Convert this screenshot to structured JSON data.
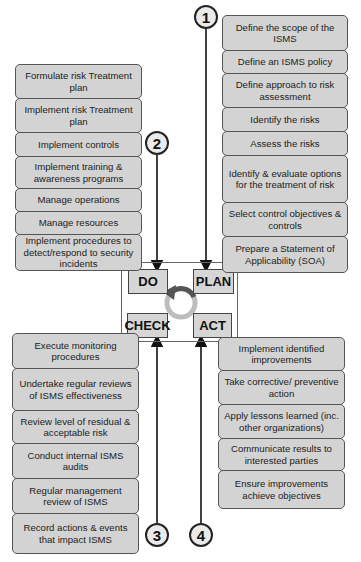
{
  "plan": {
    "number": "1",
    "label": "PLAN",
    "steps": [
      "Define the scope of the ISMS",
      "Define an ISMS policy",
      "Define approach to risk assessment",
      "Identify the risks",
      "Assess the risks",
      "Identify & evaluate options for the treatment of risk",
      "Select control objectives & controls",
      "Prepare a Statement of Applicability (SOA)"
    ]
  },
  "do": {
    "number": "2",
    "label": "DO",
    "steps": [
      "Formulate risk Treatment plan",
      "Implement risk Treatment plan",
      "Implement controls",
      "Implement training & awareness programs",
      "Manage operations",
      "Manage resources",
      "Implement procedures to detect/respond to security incidents"
    ]
  },
  "check": {
    "number": "3",
    "label": "CHECK",
    "steps": [
      "Execute monitoring procedures",
      "Undertake regular reviews of ISMS effectiveness",
      "Review level of residual & acceptable risk",
      "Conduct internal ISMS audits",
      "Regular management review of ISMS",
      "Record actions & events that impact ISMS"
    ]
  },
  "act": {
    "number": "4",
    "label": "ACT",
    "steps": [
      "Implement identified improvements",
      "Take corrective/ preventive action",
      "Apply lessons learned (inc. other organizations)",
      "Communicate results to interested parties",
      "Ensure improvements achieve objectives"
    ]
  },
  "colors": {
    "box_fill": "#d3d3d3",
    "box_border": "#555555",
    "cycle_arrow": "#555555",
    "cycle_ring": "#bdbdbd"
  }
}
